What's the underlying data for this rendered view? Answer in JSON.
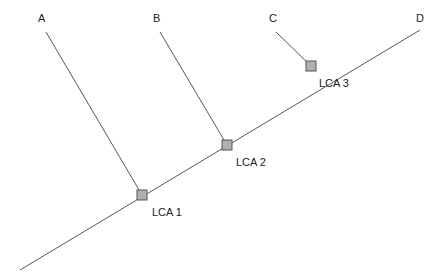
{
  "diagram": {
    "type": "cladogram",
    "taxa": [
      {
        "label": "A",
        "x": 42,
        "y": 20
      },
      {
        "label": "B",
        "x": 157,
        "y": 20
      },
      {
        "label": "C",
        "x": 273,
        "y": 20
      },
      {
        "label": "D",
        "x": 420,
        "y": 20
      }
    ],
    "nodes": [
      {
        "label": "LCA 1",
        "x": 142,
        "y": 195
      },
      {
        "label": "LCA 2",
        "x": 227,
        "y": 145
      },
      {
        "label": "LCA 3",
        "x": 311,
        "y": 66
      }
    ],
    "colors": {
      "line": "#555555",
      "node_fill": "#b0b0b0",
      "node_stroke": "#555555"
    }
  }
}
